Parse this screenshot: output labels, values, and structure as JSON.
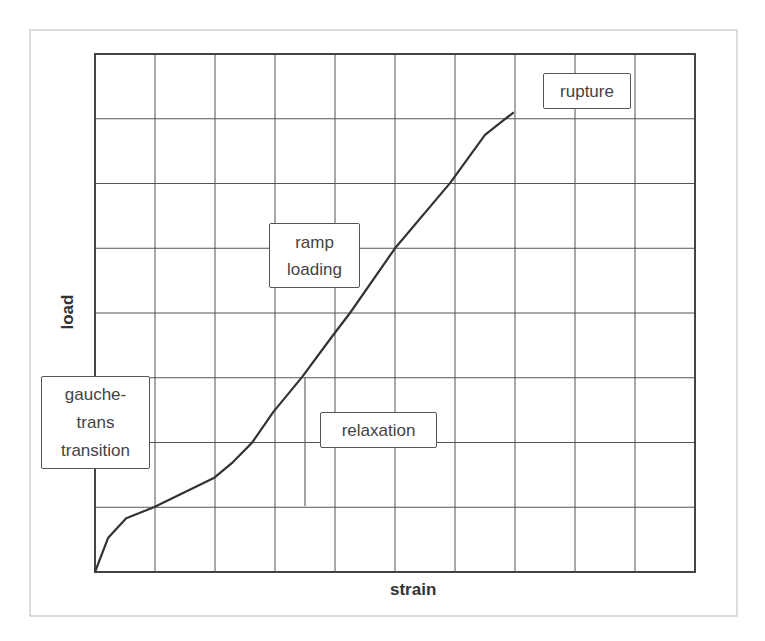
{
  "chart_data": {
    "type": "line",
    "title": "",
    "xlabel": "strain",
    "ylabel": "load",
    "xlim": [
      0,
      10
    ],
    "ylim": [
      0,
      8
    ],
    "grid": true,
    "x_divisions": 10,
    "y_divisions": 8,
    "tick_labels_shown": false,
    "legend": "none",
    "series": [
      {
        "name": "load-strain curve",
        "color": "#333333",
        "x": [
          0,
          0.22,
          0.52,
          0.98,
          1.98,
          2.28,
          2.62,
          2.97,
          3.45,
          3.97,
          4.25,
          5.0,
          5.92,
          6.5,
          6.8,
          6.98
        ],
        "y": [
          0,
          0.53,
          0.83,
          1.0,
          1.45,
          1.68,
          2.0,
          2.47,
          3.01,
          3.66,
          4.0,
          5.0,
          6.01,
          6.75,
          6.97,
          7.1
        ]
      }
    ],
    "relaxation_line": {
      "x": 3.5,
      "y_from": 3.01,
      "y_to": 1.02
    },
    "annotations": [
      {
        "id": "rupture",
        "text": [
          "rupture"
        ]
      },
      {
        "id": "ramp",
        "text": [
          "ramp",
          "loading"
        ]
      },
      {
        "id": "relaxation",
        "text": [
          "relaxation"
        ]
      },
      {
        "id": "gauche",
        "text": [
          "gauche-",
          "trans",
          "transition"
        ]
      }
    ]
  },
  "labels": {
    "x_axis": "strain",
    "y_axis": "load",
    "rupture": "rupture",
    "ramp_line1": "ramp",
    "ramp_line2": "loading",
    "relaxation": "relaxation",
    "gauche_line1": "gauche-",
    "gauche_line2": "trans",
    "gauche_line3": "transition"
  },
  "colors": {
    "curve": "#333333",
    "grid": "#555555",
    "frame": "#bbbbbb",
    "background": "#ffffff"
  }
}
